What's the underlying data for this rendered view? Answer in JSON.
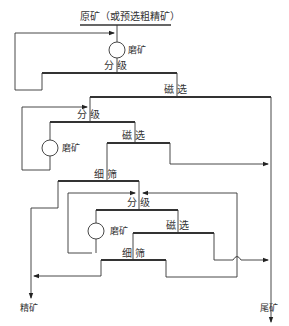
{
  "diagram": {
    "type": "mineral-processing-flowsheet",
    "caption_cut": "（图题被裁切）",
    "feed": "原矿（或预选粗精矿）",
    "nodes": {
      "grind1": "磨矿",
      "classify1": "分 级",
      "magsep1": "磁 选",
      "classify2": "分 级",
      "grind2": "磨矿",
      "magsep2": "磁 选",
      "screen1": "细 筛",
      "classify3": "分 级",
      "grind3": "磨矿",
      "magsep3": "磁 选",
      "screen2": "细 筛"
    },
    "products": {
      "concentrate": "精矿",
      "tailings": "尾矿"
    },
    "colors": {
      "line": "#333333",
      "bar": "#222222"
    }
  }
}
